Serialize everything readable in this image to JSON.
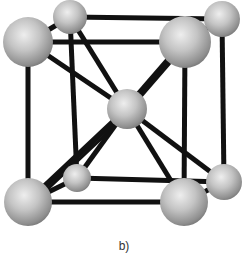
{
  "figure": {
    "caption": "b)",
    "colors": {
      "bond": "#111111",
      "atom_light": "#eeeeee",
      "atom_mid": "#b8b8b8",
      "atom_dark": "#6e6e6e"
    },
    "atoms": [
      {
        "id": "back-top-left",
        "cx": 70,
        "cy": 17,
        "r": 17
      },
      {
        "id": "back-top-right",
        "cx": 222,
        "cy": 19,
        "r": 18
      },
      {
        "id": "back-bottom-left",
        "cx": 77,
        "cy": 178,
        "r": 14
      },
      {
        "id": "back-bottom-right",
        "cx": 224,
        "cy": 182,
        "r": 18
      },
      {
        "id": "center",
        "cx": 127,
        "cy": 109,
        "r": 20
      },
      {
        "id": "front-top-left",
        "cx": 28,
        "cy": 42,
        "r": 25
      },
      {
        "id": "front-top-right",
        "cx": 185,
        "cy": 42,
        "r": 26
      },
      {
        "id": "front-bottom-left",
        "cx": 28,
        "cy": 202,
        "r": 24
      },
      {
        "id": "front-bottom-right",
        "cx": 184,
        "cy": 202,
        "r": 24
      }
    ],
    "bonds": [
      {
        "from": "back-top-left",
        "to": "back-top-right",
        "w": 5
      },
      {
        "from": "back-top-left",
        "to": "back-bottom-left",
        "w": 5
      },
      {
        "from": "back-top-right",
        "to": "back-bottom-right",
        "w": 5
      },
      {
        "from": "back-bottom-left",
        "to": "back-bottom-right",
        "w": 5
      },
      {
        "from": "front-top-left",
        "to": "front-top-right",
        "w": 5
      },
      {
        "from": "front-top-left",
        "to": "front-bottom-left",
        "w": 5
      },
      {
        "from": "front-top-right",
        "to": "front-bottom-right",
        "w": 5
      },
      {
        "from": "front-bottom-left",
        "to": "front-bottom-right",
        "w": 5
      },
      {
        "from": "front-top-left",
        "to": "back-top-left",
        "w": 5
      },
      {
        "from": "front-top-right",
        "to": "back-top-right",
        "w": 5
      },
      {
        "from": "front-bottom-left",
        "to": "back-bottom-left",
        "w": 5
      },
      {
        "from": "front-bottom-right",
        "to": "back-bottom-right",
        "w": 5
      },
      {
        "from": "center",
        "to": "front-top-left",
        "w": 5
      },
      {
        "from": "center",
        "to": "front-top-right",
        "w": 8
      },
      {
        "from": "center",
        "to": "back-top-left",
        "w": 5
      },
      {
        "from": "center",
        "to": "back-bottom-right",
        "w": 5
      },
      {
        "from": "center",
        "to": "front-bottom-left",
        "w": 6
      },
      {
        "from": "center",
        "to": "front-bottom-right",
        "w": 5
      },
      {
        "from": "center",
        "to": "back-bottom-left",
        "w": 5
      },
      {
        "from": "front-bottom-left",
        "to": "center",
        "w": 3,
        "offset": 4
      }
    ]
  }
}
